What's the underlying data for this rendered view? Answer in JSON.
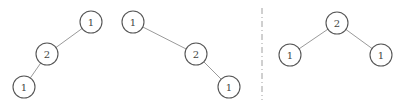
{
  "diagram": {
    "node_radius": 11,
    "colors": {
      "edge": "#9a9a9a",
      "node_stroke": "#555555",
      "divider": "#a0a0a0"
    },
    "divider": {
      "x": 262,
      "y1": 8,
      "y2": 100,
      "style": "dash-dot"
    },
    "trees": [
      {
        "id": "left-skewed",
        "nodes": [
          {
            "id": "a",
            "label": "1",
            "x": 91,
            "y": 22
          },
          {
            "id": "b",
            "label": "2",
            "x": 47,
            "y": 54
          },
          {
            "id": "c",
            "label": "1",
            "x": 24,
            "y": 87
          }
        ],
        "edges": [
          [
            "a",
            "b"
          ],
          [
            "b",
            "c"
          ]
        ]
      },
      {
        "id": "right-skewed",
        "nodes": [
          {
            "id": "a",
            "label": "1",
            "x": 133,
            "y": 22
          },
          {
            "id": "b",
            "label": "2",
            "x": 196,
            "y": 54
          },
          {
            "id": "c",
            "label": "1",
            "x": 229,
            "y": 87
          }
        ],
        "edges": [
          [
            "a",
            "b"
          ],
          [
            "b",
            "c"
          ]
        ]
      },
      {
        "id": "balanced",
        "nodes": [
          {
            "id": "a",
            "label": "2",
            "x": 337,
            "y": 23
          },
          {
            "id": "b",
            "label": "1",
            "x": 290,
            "y": 55
          },
          {
            "id": "c",
            "label": "1",
            "x": 381,
            "y": 55
          }
        ],
        "edges": [
          [
            "a",
            "b"
          ],
          [
            "a",
            "c"
          ]
        ]
      }
    ]
  }
}
